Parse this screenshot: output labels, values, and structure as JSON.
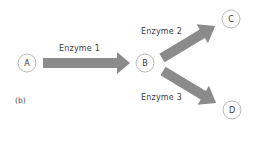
{
  "diagram": {
    "panel_label": "(b)",
    "colors": {
      "arrow": "#8b8b8b",
      "circle_stroke": "#b9b9b9",
      "text": "#3c3c3c",
      "background": "#ffffff"
    },
    "nodes": [
      {
        "id": "A",
        "label": "A",
        "cx": 27,
        "cy": 63
      },
      {
        "id": "B",
        "label": "B",
        "cx": 145,
        "cy": 63
      },
      {
        "id": "C",
        "label": "C",
        "cx": 231,
        "cy": 19
      },
      {
        "id": "D",
        "label": "D",
        "cx": 232,
        "cy": 110
      }
    ],
    "edges": [
      {
        "from": "A",
        "to": "B",
        "label": "Enzyme 1"
      },
      {
        "from": "B",
        "to": "C",
        "label": "Enzyme 2"
      },
      {
        "from": "B",
        "to": "D",
        "label": "Enzyme 3"
      }
    ]
  }
}
